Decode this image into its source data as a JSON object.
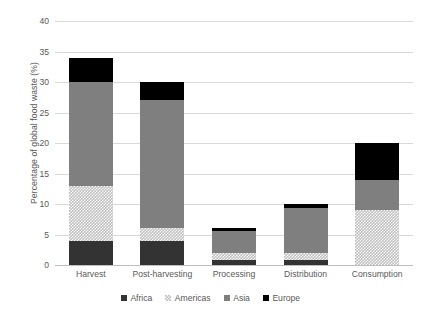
{
  "chart_data": {
    "type": "bar",
    "subtype": "stacked-bar",
    "title": "",
    "xlabel": "",
    "ylabel": "Percentage of global food waste (%)",
    "ylim": [
      0,
      40
    ],
    "ytick_step": 5,
    "ytick_labels": [
      "0",
      "5",
      "10",
      "15",
      "20",
      "25",
      "30",
      "35",
      "40"
    ],
    "grid": true,
    "legend_position": "bottom",
    "categories": [
      "Harvest",
      "Post-harvesting",
      "Processing",
      "Distribution",
      "Consumption"
    ],
    "series": [
      {
        "name": "Africa",
        "color": "#333333",
        "values": [
          4,
          4,
          0.8,
          0.8,
          0
        ]
      },
      {
        "name": "Americas",
        "color": "#bfbfbf",
        "values": [
          9,
          2,
          1.2,
          1.2,
          9
        ]
      },
      {
        "name": "Asia",
        "color": "#7f7f7f",
        "values": [
          17,
          21,
          3.5,
          7.3,
          5
        ]
      },
      {
        "name": "Europe",
        "color": "#000000",
        "values": [
          4,
          3,
          0.5,
          0.7,
          6
        ]
      }
    ],
    "totals": [
      34,
      30,
      6,
      10,
      20
    ]
  },
  "legend": {
    "items": [
      {
        "label": "Africa",
        "swatch": "legend-swatch-africa"
      },
      {
        "label": "Americas",
        "swatch": "legend-swatch-americas"
      },
      {
        "label": "Asia",
        "swatch": "legend-swatch-asia"
      },
      {
        "label": "Europe",
        "swatch": "legend-swatch-europe"
      }
    ]
  },
  "colors": {
    "africa": "#333333",
    "americas": "#bfbfbf",
    "asia": "#7f7f7f",
    "europe": "#000000",
    "gridline": "#d9d9d9",
    "axis": "#bfbfbf",
    "text": "#595959",
    "background": "#ffffff"
  }
}
